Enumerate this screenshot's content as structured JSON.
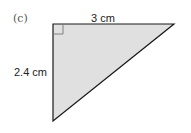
{
  "figure": {
    "part_label": "(c)",
    "shape": "right-triangle",
    "fill_color": "#e0e0e0",
    "stroke_color": "#1a1a1a",
    "top_side_label": "3 cm",
    "left_side_label": "2.4 cm"
  }
}
